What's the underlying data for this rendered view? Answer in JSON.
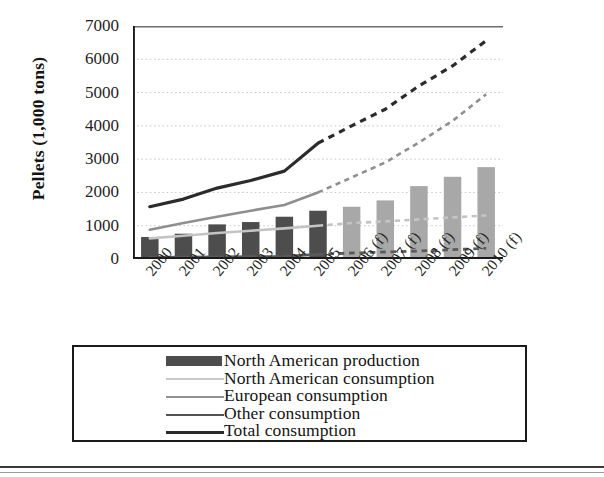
{
  "chart_data": {
    "type": "bar",
    "title": "",
    "xlabel": "",
    "ylabel": "Pellets (1,000 tons)",
    "ylim": [
      0,
      7000
    ],
    "yticks": [
      0,
      1000,
      2000,
      3000,
      4000,
      5000,
      6000,
      7000
    ],
    "ytick_labels": [
      "0",
      "1000",
      "2000",
      "3000",
      "4000",
      "5000",
      "6000",
      "7000"
    ],
    "grid": "horizontal dotted gridlines",
    "legend_position": "below plot, boxed",
    "categories": [
      "2000",
      "2001",
      "2002",
      "2003",
      "2004",
      "2005",
      "2006 (f)",
      "2007 (f)",
      "2008 (f)",
      "2009 (f)",
      "2010 (f)"
    ],
    "forecast_from": "2006 (f)",
    "series": [
      {
        "name": "North American production",
        "kind": "bar",
        "color": "#4d4d4d",
        "forecast_color": "#a8a8a8",
        "values": [
          660,
          760,
          1040,
          1110,
          1270,
          1450,
          1570,
          1760,
          2190,
          2470,
          2760
        ]
      },
      {
        "name": "North American consumption",
        "kind": "line",
        "color": "#c4c4c4",
        "values": [
          620,
          700,
          780,
          850,
          920,
          1000,
          1080,
          1130,
          1190,
          1250,
          1310
        ]
      },
      {
        "name": "European consumption",
        "kind": "line",
        "color": "#8f8f8f",
        "values": [
          880,
          1080,
          1270,
          1450,
          1620,
          2000,
          2450,
          2900,
          3500,
          4150,
          4950
        ]
      },
      {
        "name": "Other consumption",
        "kind": "line",
        "color": "#5a5a5a",
        "values": [
          50,
          55,
          60,
          70,
          80,
          140,
          180,
          210,
          240,
          280,
          320
        ]
      },
      {
        "name": "Total consumption",
        "kind": "line",
        "color": "#2b2b2b",
        "values": [
          1570,
          1800,
          2130,
          2360,
          2640,
          3480,
          4000,
          4500,
          5200,
          5800,
          6560
        ]
      }
    ]
  },
  "legend": {
    "entries": [
      {
        "label": "North American production",
        "swatch": "bar",
        "color": "#4d4d4d"
      },
      {
        "label": "North American consumption",
        "swatch": "line",
        "color": "#c9c9c9"
      },
      {
        "label": "European consumption",
        "swatch": "line",
        "color": "#919191"
      },
      {
        "label": "Other consumption",
        "swatch": "line",
        "color": "#545454"
      },
      {
        "label": "Total consumption",
        "swatch": "line",
        "color": "#2b2b2b"
      }
    ]
  }
}
